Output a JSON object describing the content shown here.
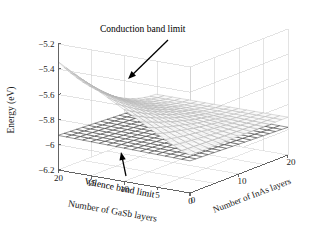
{
  "chart_data": {
    "type": "surface",
    "title": "",
    "subtitle": "",
    "xlabel": "Number of GaSb layers",
    "ylabel": "Number of InAs layers",
    "zlabel": "Energy (eV)",
    "grid": true,
    "legend": "none",
    "projection": "3d",
    "xlim": [
      0,
      20
    ],
    "ylim": [
      0,
      20
    ],
    "zlim": [
      -6.2,
      -5.2
    ],
    "xticks": [
      20,
      15,
      10,
      5,
      0
    ],
    "xtick_labels": [
      "20",
      "15",
      "10",
      "5",
      "0"
    ],
    "yticks": [
      0,
      10,
      20
    ],
    "ytick_labels": [
      "0",
      "10",
      "20"
    ],
    "zticks": [
      -5.2,
      -5.4,
      -5.6,
      -5.8,
      -6,
      -6.2
    ],
    "ztick_labels": [
      "−5.2",
      "−5.4",
      "−5.6",
      "−5.8",
      "−6",
      "−6.2"
    ],
    "x_axis_direction": "descending-left-to-right",
    "y_axis_direction": "ascending-left-to-right",
    "annotations": [
      {
        "id": "conduction-band-limit",
        "text": "Conduction band limit",
        "text_x": 100,
        "text_y": 32,
        "arrow_from_x": 168,
        "arrow_from_y": 40,
        "arrow_to_x": 128,
        "arrow_to_y": 79
      },
      {
        "id": "valence-band-limit",
        "text": "Valence band limit",
        "text_x": 84,
        "text_y": 184,
        "arrow_from_x": 126,
        "arrow_from_y": 176,
        "arrow_to_x": 121,
        "arrow_to_y": 152
      }
    ],
    "series": [
      {
        "name": "Conduction band limit",
        "surface": "upper",
        "style": "light-gray-mesh",
        "color": "#b4b4b4",
        "z_range": [
          -5.92,
          -5.34
        ],
        "description": "Thin curved sheet peaking near GaSb=20 / InAs=0 at about -5.35 eV and falling steeply toward -5.9 eV as InAs layers increase"
      },
      {
        "name": "Valence band limit",
        "surface": "lower",
        "style": "dark-dense-mesh",
        "color": "#3c3c3c",
        "z_range": [
          -6.03,
          -5.9
        ],
        "description": "Nearly flat dense mesh sheet around -5.95 eV across the whole domain"
      }
    ],
    "grid_x_count": 4,
    "grid_y_count": 4,
    "grid_z_count": 5,
    "mesh_n_x": 16,
    "mesh_n_y": 16
  },
  "axes": {
    "z_title": "Energy (eV)",
    "x_title": "Number of GaSb layers",
    "y_title": "Number of InAs layers",
    "z_ticks": [
      "−5.2",
      "−5.4",
      "−5.6",
      "−5.8",
      "−6",
      "−6.2"
    ],
    "x_ticks": [
      "20",
      "15",
      "10",
      "5",
      "0"
    ],
    "y_ticks": [
      "0",
      "10",
      "20"
    ]
  },
  "annotations": {
    "conduction": "Conduction band limit",
    "valence": "Valence band limit"
  },
  "colors": {
    "background": "#ffffff",
    "axis_line": "#555555",
    "grid_line": "#c8c8c8",
    "tick_label": "#1a1a1a",
    "conduction_mesh": "#b4b4b4",
    "valence_mesh": "#3c3c3c",
    "annotation": "#000000"
  }
}
